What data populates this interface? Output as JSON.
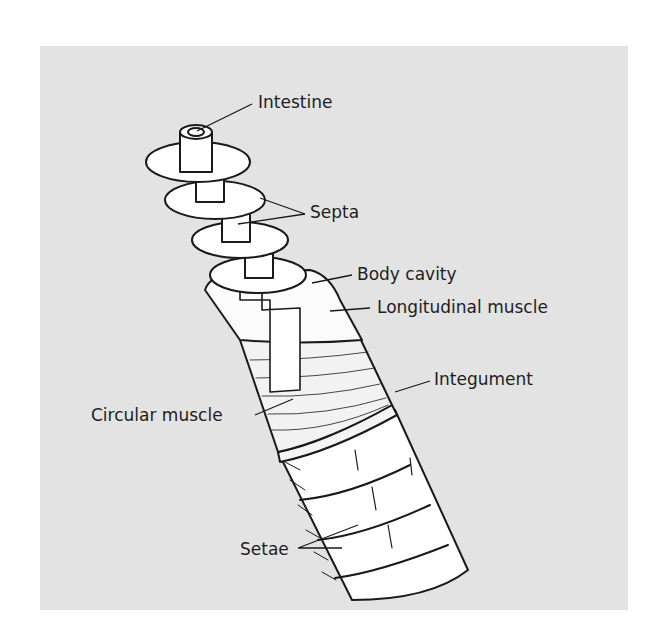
{
  "figure": {
    "background_color": "#e3e3e3",
    "labels": {
      "intestine": "Intestine",
      "septa": "Septa",
      "body_cavity": "Body cavity",
      "longitudinal_muscle": "Longitudinal muscle",
      "integument": "Integument",
      "circular_muscle": "Circular muscle",
      "setae": "Setae"
    }
  }
}
